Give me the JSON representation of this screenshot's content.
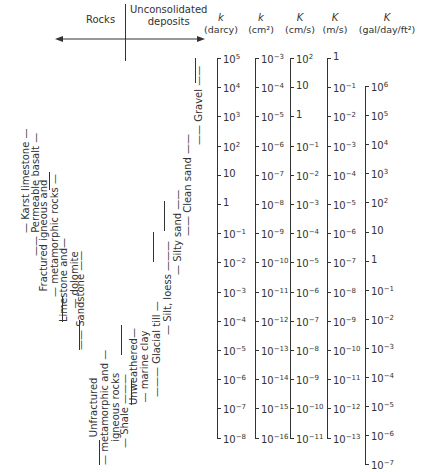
{
  "header": {
    "rocks_label": "Rocks",
    "unconsolidated_label": "Unconsolidated deposits",
    "unconsolidated_line1": "Unconsolidated",
    "unconsolidated_line2": "deposits"
  },
  "columns": [
    {
      "symbol": "k",
      "unit": "(darcy)",
      "ticks": [
        "10^5",
        "10^4",
        "10^3",
        "10^2",
        "10",
        "1",
        "10^-1",
        "10^-2",
        "10^-3",
        "10^-4",
        "10^-5",
        "10^-6",
        "10^-7",
        "10^-8"
      ]
    },
    {
      "symbol": "k",
      "unit": "(cm²)",
      "ticks": [
        "10^-3",
        "10^-4",
        "10^-5",
        "10^-6",
        "10^-7",
        "10^-8",
        "10^-9",
        "10^-10",
        "10^-11",
        "10^-12",
        "10^-13",
        "10^-14",
        "10^-15",
        "10^-16"
      ]
    },
    {
      "symbol": "K",
      "unit": "(cm/s)",
      "ticks": [
        "10^2",
        "10",
        "1",
        "10^-1",
        "10^-2",
        "10^-3",
        "10^-4",
        "10^-5",
        "10^-6",
        "10^-7",
        "10^-8",
        "10^-9",
        "10^-10",
        "10^-11"
      ]
    },
    {
      "symbol": "K",
      "unit": "(m/s)",
      "ticks": [
        "1",
        "10^-1",
        "10^-2",
        "10^-3",
        "10^-4",
        "10^-5",
        "10^-6",
        "10^-7",
        "10^-8",
        "10^-9",
        "10^-10",
        "10^-11",
        "10^-12",
        "10^-13"
      ]
    },
    {
      "symbol": "K",
      "unit": "(gal/day/ft²)",
      "ticks": [
        "10^6",
        "10^5",
        "10^4",
        "10^3",
        "10^2",
        "10",
        "1",
        "10^-1",
        "10^-2",
        "10^-3",
        "10^-4",
        "10^-5",
        "10^-6",
        "10^-7"
      ]
    }
  ],
  "rocks": [
    {
      "name": "Karst limestone"
    },
    {
      "name": "Permeable basalt"
    },
    {
      "name": "Fractured igneous and metamorphic rocks",
      "line1": "Fractured igneous and",
      "line2": "metamorphic rocks"
    },
    {
      "name": "Limestone and dolomite",
      "line1": "Limestone and",
      "line2": "dolomite"
    },
    {
      "name": "Sandstone"
    },
    {
      "name": "Unfractured metamorphic and igneous rocks",
      "line1": "Unfractured",
      "line2": "metamorphic and",
      "line3": "igneous rocks"
    },
    {
      "name": "Shale"
    }
  ],
  "deposits": [
    {
      "name": "Unweathered marine clay",
      "line1": "Unweathered",
      "line2": "marine clay"
    },
    {
      "name": "Glacial till"
    },
    {
      "name": "Silt, loess"
    },
    {
      "name": "Silty sand"
    },
    {
      "name": "Clean sand"
    },
    {
      "name": "Gravel"
    }
  ],
  "chart_data": {
    "type": "table",
    "scales": [
      {
        "label": "k (darcy)",
        "range": [
          "10^5",
          "10^-8"
        ]
      },
      {
        "label": "k (cm^2)",
        "range": [
          "10^-3",
          "10^-16"
        ]
      },
      {
        "label": "K (cm/s)",
        "range": [
          "10^2",
          "10^-11"
        ]
      },
      {
        "label": "K (m/s)",
        "range": [
          "1",
          "10^-13"
        ]
      },
      {
        "label": "K (gal/day/ft^2)",
        "range": [
          "10^6",
          "10^-7"
        ]
      }
    ],
    "materials_K_cm_s_approx_range": [
      {
        "material": "Gravel",
        "category": "Unconsolidated deposits",
        "max": "10^2",
        "min": "10^-1"
      },
      {
        "material": "Clean sand",
        "category": "Unconsolidated deposits",
        "max": "1",
        "min": "10^-4"
      },
      {
        "material": "Silty sand",
        "category": "Unconsolidated deposits",
        "max": "10^-1",
        "min": "10^-5"
      },
      {
        "material": "Silt, loess",
        "category": "Unconsolidated deposits",
        "max": "10^-3",
        "min": "10^-7"
      },
      {
        "material": "Glacial till",
        "category": "Unconsolidated deposits",
        "max": "10^-4",
        "min": "10^-10"
      },
      {
        "material": "Unweathered marine clay",
        "category": "Unconsolidated deposits",
        "max": "10^-7",
        "min": "10^-10"
      },
      {
        "material": "Karst limestone",
        "category": "Rocks",
        "max": "1",
        "min": "10^-4"
      },
      {
        "material": "Permeable basalt",
        "category": "Rocks",
        "max": "1",
        "min": "10^-5"
      },
      {
        "material": "Fractured igneous and metamorphic rocks",
        "category": "Rocks",
        "max": "10^-2",
        "min": "10^-6"
      },
      {
        "material": "Limestone and dolomite",
        "category": "Rocks",
        "max": "10^-4",
        "min": "10^-7"
      },
      {
        "material": "Sandstone",
        "category": "Rocks",
        "max": "10^-4",
        "min": "10^-8"
      },
      {
        "material": "Shale",
        "category": "Rocks",
        "max": "10^-7",
        "min": "10^-11"
      },
      {
        "material": "Unfractured metamorphic and igneous rocks",
        "category": "Rocks",
        "max": "10^-8",
        "min": "10^-12"
      }
    ]
  }
}
